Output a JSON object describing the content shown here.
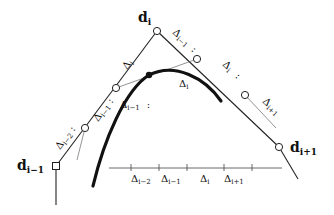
{
  "diagram": {
    "control_points": {
      "d_i": "d",
      "d_i_sub": "i",
      "d_im1": "d",
      "d_im1_sub": "i−1",
      "d_ip1": "d",
      "d_ip1_sub": "i+1"
    },
    "polygon_labels": {
      "left_upper": {
        "base": "Δ",
        "sub": "i"
      },
      "left_mid": {
        "base": "Δ",
        "sub": "i−1"
      },
      "left_lower": {
        "base": "Δ",
        "sub": "i−2"
      },
      "right_upper": {
        "base": "Δ",
        "sub": "i−1"
      },
      "right_mid": {
        "base": "Δ",
        "sub": "i"
      },
      "right_lower": {
        "base": "Δ",
        "sub": "i+1"
      },
      "ratio_sep": ":"
    },
    "inner_labels": {
      "left": {
        "base": "Δ",
        "sub": "i−1"
      },
      "right": {
        "base": "Δ",
        "sub": "i"
      },
      "ratio_sep": ":"
    },
    "axis": {
      "intervals": [
        {
          "base": "Δ",
          "sub": "i−2"
        },
        {
          "base": "Δ",
          "sub": "i−1"
        },
        {
          "base": "Δ",
          "sub": "i"
        },
        {
          "base": "Δ",
          "sub": "i+1"
        }
      ]
    },
    "colors": {
      "line": "#222222",
      "thin_line": "#555555",
      "curve": "#111111"
    }
  }
}
